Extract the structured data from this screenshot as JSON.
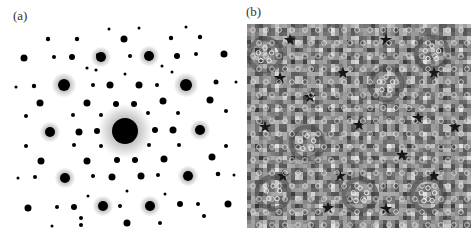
{
  "figure": {
    "panels": [
      {
        "label": "(a)",
        "description": "electron diffraction pattern, tenfold symmetry",
        "background": "#ffffff",
        "spot_color": "#000000",
        "center": [
          125,
          131
        ],
        "spots": [
          [
            125,
            131,
            13,
            1
          ],
          [
            50,
            132,
            5,
            1
          ],
          [
            200,
            130,
            5,
            1
          ],
          [
            64,
            85,
            6,
            1
          ],
          [
            186,
            85,
            6,
            1
          ],
          [
            65,
            178,
            5,
            1
          ],
          [
            188,
            176,
            5,
            1
          ],
          [
            101,
            57,
            5,
            1
          ],
          [
            149,
            56,
            5,
            1
          ],
          [
            103,
            206,
            5,
            1
          ],
          [
            150,
            206,
            5,
            1
          ],
          [
            24,
            58,
            3.5,
            0
          ],
          [
            224,
            54,
            3.5,
            0
          ],
          [
            28,
            208,
            3.5,
            0
          ],
          [
            228,
            204,
            3.5,
            0
          ],
          [
            124,
            39,
            3.5,
            0
          ],
          [
            127,
            223,
            3.5,
            0
          ],
          [
            72,
            57,
            3,
            0
          ],
          [
            177,
            56,
            3,
            0
          ],
          [
            110,
            85,
            3.5,
            0
          ],
          [
            139,
            85,
            3.5,
            0
          ],
          [
            40,
            103,
            3.5,
            0
          ],
          [
            87,
            103,
            3.5,
            0
          ],
          [
            116,
            104,
            3,
            0
          ],
          [
            134,
            104,
            3,
            0
          ],
          [
            163,
            101,
            3.5,
            0
          ],
          [
            210,
            100,
            3.5,
            0
          ],
          [
            79,
            132,
            3.5,
            0
          ],
          [
            97,
            131,
            3,
            0
          ],
          [
            155,
            130,
            3,
            0
          ],
          [
            173,
            130,
            3.5,
            0
          ],
          [
            41,
            161,
            3.5,
            0
          ],
          [
            87,
            161,
            3.5,
            0
          ],
          [
            117,
            160,
            3,
            0
          ],
          [
            135,
            160,
            3,
            0
          ],
          [
            164,
            159,
            3.5,
            0
          ],
          [
            212,
            157,
            3.5,
            0
          ],
          [
            112,
            177,
            3.5,
            0
          ],
          [
            141,
            176,
            3.5,
            0
          ],
          [
            74,
            207,
            3,
            0
          ],
          [
            180,
            204,
            3,
            0
          ],
          [
            48,
            39,
            2.2,
            0
          ],
          [
            77,
            39,
            2.2,
            0
          ],
          [
            171,
            38,
            2.2,
            0
          ],
          [
            200,
            37,
            2.2,
            0
          ],
          [
            54,
            57,
            2,
            0
          ],
          [
            98,
            55,
            2,
            0
          ],
          [
            130,
            56,
            2,
            0
          ],
          [
            196,
            54,
            2,
            0
          ],
          [
            34,
            86,
            2.2,
            0
          ],
          [
            93,
            85,
            2,
            0
          ],
          [
            157,
            85,
            2,
            0
          ],
          [
            216,
            82,
            2.5,
            0
          ],
          [
            26,
            116,
            2,
            0
          ],
          [
            73,
            115,
            2,
            0
          ],
          [
            101,
            115,
            2,
            0
          ],
          [
            148,
            113,
            2,
            0
          ],
          [
            178,
            113,
            2,
            0
          ],
          [
            226,
            111,
            2,
            0
          ],
          [
            26,
            146,
            2,
            0
          ],
          [
            74,
            145,
            2,
            0
          ],
          [
            101,
            146,
            2,
            0
          ],
          [
            149,
            145,
            2,
            0
          ],
          [
            179,
            145,
            2,
            0
          ],
          [
            226,
            146,
            2,
            0
          ],
          [
            35,
            177,
            2,
            0
          ],
          [
            93,
            176,
            2,
            0
          ],
          [
            158,
            175,
            2,
            0
          ],
          [
            218,
            174,
            2.3,
            0
          ],
          [
            57,
            207,
            2,
            0
          ],
          [
            120,
            206,
            2,
            0
          ],
          [
            198,
            204,
            2,
            0
          ],
          [
            81,
            218,
            2,
            0
          ],
          [
            160,
            223,
            2,
            0
          ],
          [
            204,
            216,
            2,
            0
          ],
          [
            81,
            225,
            2,
            0
          ],
          [
            109,
            29,
            1.5,
            0
          ],
          [
            139,
            28,
            1.5,
            0
          ],
          [
            186,
            27,
            1.5,
            0
          ],
          [
            16,
            87,
            1.5,
            0
          ],
          [
            236,
            82,
            1.5,
            0
          ],
          [
            18,
            178,
            1.5,
            0
          ],
          [
            234,
            175,
            1.5,
            0
          ],
          [
            52,
            226,
            1.5,
            0
          ],
          [
            87,
            68,
            1.6,
            0
          ],
          [
            96,
            70,
            1.6,
            0
          ],
          [
            125,
            74,
            1.5,
            0
          ],
          [
            162,
            66,
            1.5,
            0
          ],
          [
            172,
            72,
            1.5,
            0
          ],
          [
            127,
            191,
            1.5,
            0
          ],
          [
            88,
            196,
            1.5,
            0
          ],
          [
            165,
            194,
            1.5,
            0
          ]
        ]
      },
      {
        "label": "(b)",
        "description": "high-resolution image of quasicrystal atomic arrangement",
        "image_box": [
          7,
          24,
          224,
          204
        ],
        "base_color": "#8a8a8a",
        "light_color": "#d4d4d4",
        "dark_color": "#3a3a3a",
        "star_centers": [
          [
            50,
            40
          ],
          [
            146,
            40
          ],
          [
            40,
            78
          ],
          [
            103,
            73
          ],
          [
            194,
            73
          ],
          [
            70,
            97
          ],
          [
            25,
            127
          ],
          [
            119,
            125
          ],
          [
            178,
            118
          ],
          [
            215,
            127
          ],
          [
            162,
            155
          ],
          [
            43,
            176
          ],
          [
            100,
            176
          ],
          [
            194,
            176
          ],
          [
            88,
            208
          ],
          [
            146,
            209
          ]
        ],
        "ring_centers": [
          [
            146,
            84
          ],
          [
            67,
            143
          ],
          [
            25,
            55
          ],
          [
            192,
            53
          ],
          [
            33,
            193
          ],
          [
            188,
            195
          ],
          [
            120,
            195
          ]
        ]
      }
    ]
  }
}
